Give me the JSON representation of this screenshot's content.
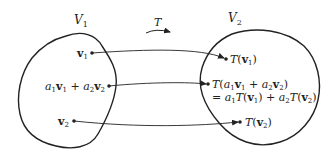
{
  "diagram": {
    "domain_label": {
      "base": "V",
      "sub": "1"
    },
    "codomain_label": {
      "base": "V",
      "sub": "2"
    },
    "map_label": "T",
    "domain_points": [
      {
        "id": "v1",
        "text": "v1"
      },
      {
        "id": "combo",
        "text": "a1v1 + a2v2"
      },
      {
        "id": "v2",
        "text": "v2"
      }
    ],
    "codomain_points": [
      {
        "id": "Tv1",
        "text": "T(v1)"
      },
      {
        "id": "Tcombo",
        "text": "T(a1v1 + a2v2)",
        "line2": "= a1T(v1) + a2T(v2)"
      },
      {
        "id": "Tv2",
        "text": "T(v2)"
      }
    ],
    "colors": {
      "stroke": "#222222",
      "background": "#ffffff"
    }
  }
}
